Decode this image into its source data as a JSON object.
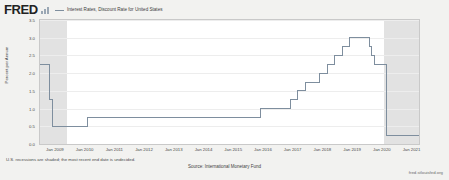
{
  "brand": {
    "logo_text": "FRED",
    "logo_bars_icon": "bar-chart-icon"
  },
  "legend": {
    "series_label": "Interest Rates, Discount Rate for United States",
    "line_color": "#7e8e9e"
  },
  "footer": {
    "recession_note": "U.S. recessions are shaded; the most recent end date is undecided.",
    "source": "Source: International Monetary Fund",
    "attribution": "fred.stlouisfed.org"
  },
  "colors": {
    "series": "#7e8e9e",
    "recession_shading": "#e2e2e2",
    "plot_background": "#ffffff",
    "page_background": "#f2f2f0",
    "gridline": "#ededed",
    "axis_text": "#4a4a4a"
  },
  "chart_data": {
    "type": "line",
    "title": "Interest Rates, Discount Rate for United States",
    "xlabel": "",
    "ylabel": "Percent per Annum",
    "ylim": [
      0.0,
      3.5
    ],
    "yticks": [
      0.0,
      0.5,
      1.0,
      1.5,
      2.0,
      2.5,
      3.0,
      3.5
    ],
    "ytick_labels": [
      "0.0",
      "0.5",
      "1.0",
      "1.5",
      "2.0",
      "2.5",
      "3.0",
      "3.5"
    ],
    "xlim": [
      "2008-07",
      "2021-04"
    ],
    "xticks": [
      "Jan 2009",
      "Jan 2010",
      "Jan 2011",
      "Jan 2012",
      "Jan 2013",
      "Jan 2014",
      "Jan 2015",
      "Jan 2016",
      "Jan 2017",
      "Jan 2018",
      "Jan 2019",
      "Jan 2020",
      "Jan 2021"
    ],
    "grid": true,
    "legend_position": "top",
    "series": [
      {
        "name": "Interest Rates, Discount Rate for United States",
        "color": "#7e8e9e",
        "step": true,
        "points": [
          {
            "date": "2008-07",
            "value": 2.25
          },
          {
            "date": "2008-10",
            "value": 2.25
          },
          {
            "date": "2008-11",
            "value": 1.25
          },
          {
            "date": "2008-12",
            "value": 0.5
          },
          {
            "date": "2009-12",
            "value": 0.5
          },
          {
            "date": "2010-02",
            "value": 0.75
          },
          {
            "date": "2015-11",
            "value": 0.75
          },
          {
            "date": "2015-12",
            "value": 1.0
          },
          {
            "date": "2016-12",
            "value": 1.25
          },
          {
            "date": "2017-03",
            "value": 1.5
          },
          {
            "date": "2017-06",
            "value": 1.75
          },
          {
            "date": "2017-12",
            "value": 2.0
          },
          {
            "date": "2018-03",
            "value": 2.25
          },
          {
            "date": "2018-06",
            "value": 2.5
          },
          {
            "date": "2018-09",
            "value": 2.75
          },
          {
            "date": "2018-12",
            "value": 3.0
          },
          {
            "date": "2019-07",
            "value": 3.0
          },
          {
            "date": "2019-08",
            "value": 2.75
          },
          {
            "date": "2019-09",
            "value": 2.5
          },
          {
            "date": "2019-10",
            "value": 2.25
          },
          {
            "date": "2020-02",
            "value": 2.25
          },
          {
            "date": "2020-03",
            "value": 0.25
          },
          {
            "date": "2021-04",
            "value": 0.25
          }
        ]
      }
    ],
    "recession_bands": [
      {
        "start": "2008-07",
        "end": "2009-06"
      },
      {
        "start": "2020-02",
        "end": "2021-04"
      }
    ]
  }
}
